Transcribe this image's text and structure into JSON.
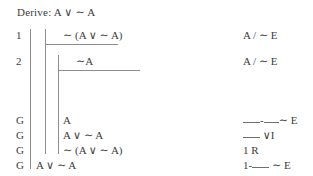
{
  "header": {
    "label": "Derive:",
    "goal_formula": "A ∨ ∼ A",
    "full_text": "Derive: A ∨ ∼ A"
  },
  "proof": {
    "rows": [
      {
        "marker": "1",
        "formula": "∼ (A ∨ ∼ A)",
        "justification": "A / ∼ E",
        "depth": 2
      },
      {
        "marker": "2",
        "formula": "∼A",
        "justification": "A / ∼ E",
        "depth": 3
      },
      {
        "marker": "G",
        "formula": "A",
        "justification_parts": [
          "blank",
          "-",
          "blank",
          " ∼E"
        ],
        "justification": "__-__ ∼E",
        "depth": 3
      },
      {
        "marker": "G",
        "formula": "A ∨ ∼ A",
        "justification_parts": [
          "blank",
          " ∨I"
        ],
        "justification": "__ ∨I",
        "depth": 3
      },
      {
        "marker": "G",
        "formula": "∼ (A ∨ ∼ A)",
        "justification": "1 R",
        "depth": 3
      },
      {
        "marker": "G",
        "formula": "A ∨ ∼ A",
        "justification_parts": [
          "1-",
          "blank",
          " ∼ E"
        ],
        "justification": "1-__ ∼ E",
        "depth": 1
      }
    ]
  },
  "symbols": {
    "disjunction": "∨",
    "negation": "∼",
    "goal_marker": "G",
    "assumption_rule_label": "A",
    "reiteration_rule": "R",
    "negation_elimination": "∼ E",
    "disjunction_introduction": "∨I"
  },
  "colors": {
    "text": "#3d3d3d",
    "rule_line": "#8d8d8d",
    "background": "#ffffff"
  }
}
